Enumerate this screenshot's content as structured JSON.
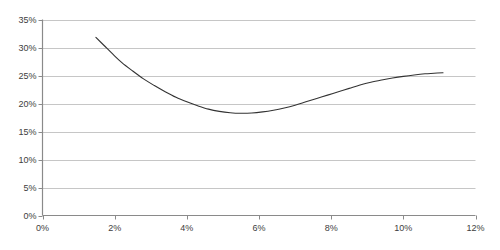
{
  "chart_data": {
    "type": "line",
    "title": "",
    "subtitle": "",
    "xlabel": "",
    "ylabel": "",
    "xlim": [
      0,
      12
    ],
    "ylim": [
      0,
      35
    ],
    "grid": true,
    "grid_axis": "y",
    "legend": false,
    "legend_position": "none",
    "x_tick_labels": [
      "0%",
      "2%",
      "4%",
      "6%",
      "8%",
      "10%",
      "12%"
    ],
    "x_ticks": [
      0,
      2,
      4,
      6,
      8,
      10,
      12
    ],
    "y_tick_labels": [
      "0%",
      "5%",
      "10%",
      "15%",
      "20%",
      "25%",
      "30%",
      "35%"
    ],
    "y_ticks": [
      0,
      5,
      10,
      15,
      20,
      25,
      30,
      35
    ],
    "series": [
      {
        "name": "curve",
        "color": "#333333",
        "line_width": 1.1,
        "x": [
          1.48,
          1.7,
          1.95,
          2.2,
          2.5,
          2.8,
          3.1,
          3.4,
          3.7,
          4.0,
          4.3,
          4.6,
          4.9,
          5.2,
          5.5,
          5.8,
          6.1,
          6.4,
          6.7,
          7.0,
          7.3,
          7.6,
          7.9,
          8.2,
          8.5,
          8.8,
          9.1,
          9.4,
          9.7,
          10.0,
          10.3,
          10.6,
          10.85,
          11.1
        ],
        "values": [
          31.8,
          30.4,
          28.8,
          27.3,
          25.8,
          24.4,
          23.2,
          22.1,
          21.1,
          20.3,
          19.6,
          19.0,
          18.6,
          18.35,
          18.25,
          18.3,
          18.5,
          18.8,
          19.2,
          19.7,
          20.3,
          20.9,
          21.5,
          22.1,
          22.7,
          23.3,
          23.8,
          24.2,
          24.55,
          24.85,
          25.1,
          25.3,
          25.4,
          25.5
        ]
      }
    ],
    "annotations": []
  },
  "axes": {
    "y_axis_color": "#8a8a8a",
    "x_axis_color": "#8a8a8a",
    "grid_color": "#b8b8b8",
    "tick_color": "#8a8a8a",
    "label_color": "#3d3d3d"
  }
}
